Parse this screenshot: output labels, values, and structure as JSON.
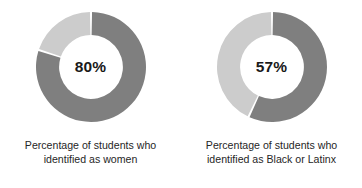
{
  "figure": {
    "background_color": "#ffffff",
    "dark_color": "#7f7f7f",
    "light_color": "#cccccc",
    "gap_color": "#ffffff",
    "label_color": "#1a1a1a",
    "caption_color": "#262626"
  },
  "chart_data": [
    {
      "type": "pie",
      "variant": "donut",
      "title": "",
      "center_label": "80%",
      "categories": [
        "Percentage of students who identified as women",
        "Remainder"
      ],
      "values": [
        80,
        20
      ],
      "colors": [
        "#7f7f7f",
        "#cccccc"
      ],
      "start_angle_deg": 0,
      "direction": "clockwise",
      "inner_radius_ratio": 0.58,
      "caption_line1": "Percentage of students who",
      "caption_line2": "identified as women",
      "legend": "none",
      "grid": false
    },
    {
      "type": "pie",
      "variant": "donut",
      "title": "",
      "center_label": "57%",
      "categories": [
        "Percentage of students who identified as Black or Latinx",
        "Remainder"
      ],
      "values": [
        57,
        43
      ],
      "colors": [
        "#7f7f7f",
        "#cccccc"
      ],
      "start_angle_deg": 0,
      "direction": "clockwise",
      "inner_radius_ratio": 0.58,
      "caption_line1": "Percentage of students who",
      "caption_line2": "identified as Black or Latinx",
      "legend": "none",
      "grid": false
    }
  ]
}
